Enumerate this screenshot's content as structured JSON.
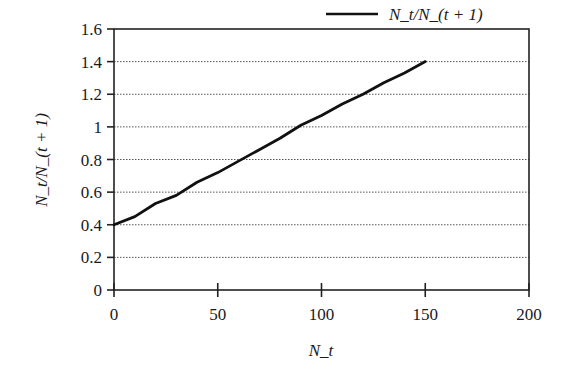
{
  "chart_data": {
    "type": "line",
    "title": "",
    "xlabel": "N_t",
    "ylabel": "N_t/N_(t + 1)",
    "xlim": [
      0,
      200
    ],
    "ylim": [
      0,
      1.6
    ],
    "xticks": [
      0,
      50,
      100,
      150,
      200
    ],
    "yticks": [
      0,
      0.2,
      0.4,
      0.6,
      0.8,
      1,
      1.2,
      1.4,
      1.6
    ],
    "xtick_labels": [
      "0",
      "50",
      "100",
      "150",
      "200"
    ],
    "ytick_labels": [
      "0",
      "0.2",
      "0.4",
      "0.6",
      "0.8",
      "1",
      "1.2",
      "1.4",
      "1.6"
    ],
    "grid": {
      "y": true,
      "x": false,
      "style": "dotted"
    },
    "legend": {
      "position": "top-right",
      "entries": [
        "N_t/N_(t + 1)"
      ]
    },
    "series": [
      {
        "name": "N_t/N_(t + 1)",
        "color": "#111111",
        "x": [
          0,
          10,
          20,
          30,
          40,
          50,
          60,
          70,
          80,
          90,
          100,
          110,
          120,
          130,
          140,
          150
        ],
        "y": [
          0.4,
          0.45,
          0.53,
          0.58,
          0.66,
          0.72,
          0.79,
          0.86,
          0.93,
          1.01,
          1.07,
          1.14,
          1.2,
          1.27,
          1.33,
          1.4
        ]
      }
    ]
  }
}
